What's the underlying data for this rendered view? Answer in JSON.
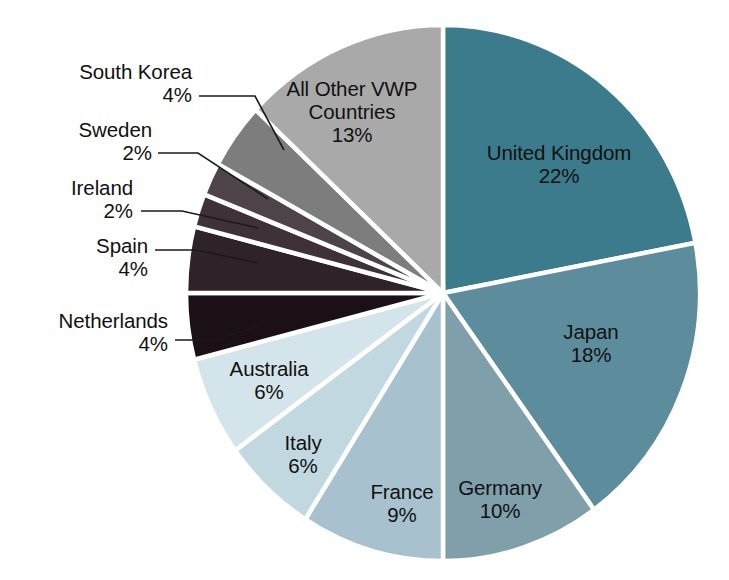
{
  "chart_data": {
    "type": "pie",
    "title": "",
    "subtitle": "",
    "xlabel": "",
    "ylabel": "",
    "legend_position": "none",
    "grid": false,
    "value_unit": "%",
    "total": 100,
    "start_angle_deg": 0,
    "direction": "clockwise",
    "categories": [
      "United Kingdom",
      "Japan",
      "Germany",
      "France",
      "Italy",
      "Australia",
      "Netherlands",
      "Spain",
      "Ireland",
      "Sweden",
      "South Korea",
      "All Other VWP Countries"
    ],
    "values": [
      22,
      18,
      10,
      9,
      6,
      6,
      4,
      4,
      2,
      2,
      4,
      13
    ],
    "slices": [
      {
        "name": "United Kingdom",
        "value": 22,
        "value_label": "22%",
        "color": "#3c7b8c",
        "label_placement": "inside",
        "label_x": 559,
        "label_y": 164,
        "text_color": "#101010"
      },
      {
        "name": "Japan",
        "value": 18,
        "value_label": "18%",
        "color": "#5d8d9d",
        "label_placement": "inside",
        "label_x": 591,
        "label_y": 343,
        "text_color": "#101010"
      },
      {
        "name": "Germany",
        "value": 10,
        "value_label": "10%",
        "color": "#7f9faa",
        "label_placement": "inside",
        "label_x": 500,
        "label_y": 499,
        "text_color": "#101010"
      },
      {
        "name": "France",
        "value": 9,
        "value_label": "9%",
        "color": "#a7c2ce",
        "label_placement": "inside",
        "label_x": 402,
        "label_y": 503,
        "text_color": "#101010"
      },
      {
        "name": "Italy",
        "value": 6,
        "value_label": "6%",
        "color": "#c2d8e0",
        "label_placement": "inside",
        "label_x": 303,
        "label_y": 454,
        "text_color": "#101010"
      },
      {
        "name": "Australia",
        "value": 6,
        "value_label": "6%",
        "color": "#d3e4ea",
        "label_placement": "inside",
        "label_x": 269,
        "label_y": 380,
        "text_color": "#101010"
      },
      {
        "name": "Netherlands",
        "value": 4,
        "value_label": "4%",
        "color": "#1b1017",
        "label_placement": "outside",
        "label_x": 168,
        "label_y": 332,
        "text_color": "#111111",
        "leader": [
          [
            175,
            340
          ],
          [
            215,
            340
          ],
          [
            262,
            325
          ]
        ]
      },
      {
        "name": "Spain",
        "value": 4,
        "value_label": "4%",
        "color": "#2f2228",
        "label_placement": "outside",
        "label_x": 148,
        "label_y": 257,
        "text_color": "#111111",
        "leader": [
          [
            155,
            250
          ],
          [
            196,
            250
          ],
          [
            258,
            263
          ]
        ]
      },
      {
        "name": "Ireland",
        "value": 2,
        "value_label": "2%",
        "color": "#3e3238",
        "label_placement": "outside",
        "label_x": 133,
        "label_y": 199,
        "text_color": "#111111",
        "leader": [
          [
            141,
            211
          ],
          [
            182,
            211
          ],
          [
            258,
            228
          ]
        ]
      },
      {
        "name": "Sweden",
        "value": 2,
        "value_label": "2%",
        "color": "#4e4349",
        "label_placement": "outside",
        "label_x": 152,
        "label_y": 141,
        "text_color": "#111111",
        "leader": [
          [
            158,
            153
          ],
          [
            198,
            153
          ],
          [
            268,
            199
          ]
        ]
      },
      {
        "name": "South Korea",
        "value": 4,
        "value_label": "4%",
        "color": "#7d7d7d",
        "label_placement": "outside",
        "label_x": 192,
        "label_y": 83,
        "text_color": "#111111",
        "leader": [
          [
            199,
            96
          ],
          [
            255,
            96
          ],
          [
            284,
            150
          ]
        ]
      },
      {
        "name": "All Other VWP Countries",
        "value": 13,
        "value_label": "13%",
        "color": "#a9a9a9",
        "label_placement": "inside",
        "label_x": 352,
        "label_y": 112,
        "text_color": "#101010"
      }
    ],
    "geometry": {
      "center_x": 443,
      "center_y": 293,
      "radius_x": 257,
      "radius_y": 268
    },
    "colors": {
      "slice_border": "#ffffff",
      "background": "#ffffff",
      "leader_line": "#1a1a1a",
      "label_text": "#121212"
    }
  }
}
